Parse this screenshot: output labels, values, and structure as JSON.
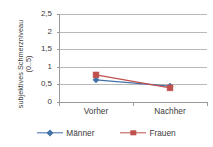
{
  "chart_data": {
    "type": "line",
    "title": "",
    "xlabel": "",
    "ylabel": "subjektives Schmerzniveau (0..5)",
    "ylabel_line1": "subjektives Schmerzniveau",
    "ylabel_line2": "(0..5)",
    "categories": [
      "Vorher",
      "Nachher"
    ],
    "ylim": [
      0,
      2.5
    ],
    "yticks": [
      "0",
      "0,5",
      "1",
      "1,5",
      "2",
      "2,5"
    ],
    "ytick_values": [
      0,
      0.5,
      1,
      1.5,
      2,
      2.5
    ],
    "grid": true,
    "grid_axis": "y",
    "legend_position": "bottom",
    "series": [
      {
        "name": "Männer",
        "values": [
          0.63,
          0.45
        ],
        "color": "#4372A8",
        "marker": "diamond"
      },
      {
        "name": "Frauen",
        "values": [
          0.77,
          0.4
        ],
        "color": "#C0504D",
        "marker": "square"
      }
    ]
  },
  "legend": {
    "items": [
      {
        "label": "Männer",
        "marker_icon": "diamond-marker-icon"
      },
      {
        "label": "Frauen",
        "marker_icon": "square-marker-icon"
      }
    ]
  },
  "colors": {
    "series_maenner": "#4372A8",
    "series_frauen": "#C0504D",
    "gridline": "#b9b9b9",
    "axis": "#9a9a9a",
    "text": "#3b3b3b",
    "background": "#ffffff"
  }
}
